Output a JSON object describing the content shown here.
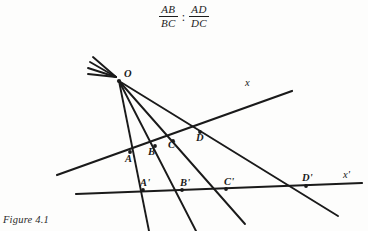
{
  "page": {
    "background_color": "#fdfdfc",
    "ink_color": "#1a1a1a"
  },
  "formula": {
    "left_fraction": {
      "numerator": "AB",
      "denominator": "BC"
    },
    "separator": ":",
    "right_fraction": {
      "numerator": "AD",
      "denominator": "DC"
    },
    "plain_text": "AB/BC : AD/DC"
  },
  "figure": {
    "caption": "Figure 4.1",
    "vertex": {
      "label": "O",
      "x": 119,
      "y": 80
    },
    "axis_labels": [
      {
        "label": "x",
        "x": 247,
        "y": 83
      },
      {
        "label": "x'",
        "x": 345,
        "y": 175
      }
    ],
    "points_upper_transversal": [
      {
        "label": "A",
        "x": 130,
        "y": 152
      },
      {
        "label": "B",
        "x": 155,
        "y": 146
      },
      {
        "label": "C",
        "x": 173,
        "y": 141
      },
      {
        "label": "D",
        "x": 200,
        "y": 132
      }
    ],
    "points_lower_transversal": [
      {
        "label": "A'",
        "x": 143,
        "y": 190
      },
      {
        "label": "B'",
        "x": 182,
        "y": 190
      },
      {
        "label": "C'",
        "x": 226,
        "y": 189
      },
      {
        "label": "D'",
        "x": 306,
        "y": 186
      }
    ],
    "lines": {
      "upper_transversal": {
        "name": "x",
        "x1": 57,
        "y1": 175,
        "x2": 292,
        "y2": 91
      },
      "lower_transversal": {
        "name": "x'",
        "x1": 76,
        "y1": 194,
        "x2": 362,
        "y2": 183
      }
    },
    "rays_from_vertex": [
      {
        "through": "A",
        "to": "A'"
      },
      {
        "through": "B",
        "to": "B'"
      },
      {
        "through": "C",
        "to": "C'"
      },
      {
        "through": "D",
        "to": "D'"
      }
    ],
    "ray_stub_count": 4
  }
}
